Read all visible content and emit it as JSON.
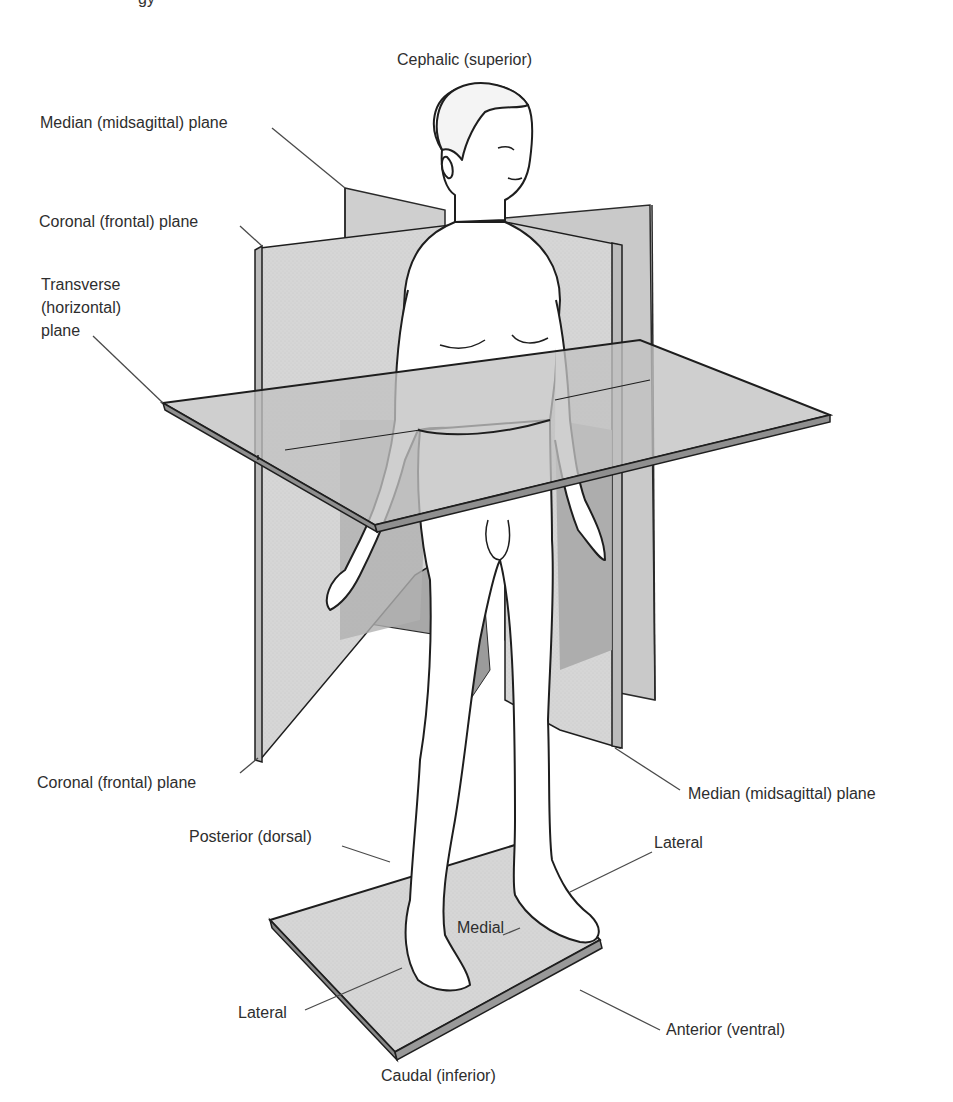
{
  "header_fragment": "gy",
  "title_top": "Cephalic (superior)",
  "title_bottom": "Caudal (inferior)",
  "labels": {
    "median_plane_top": "Median (midsagittal) plane",
    "coronal_plane_top": "Coronal (frontal) plane",
    "transverse_plane": "Transverse (horizontal) plane",
    "transverse_line1": "Transverse",
    "transverse_line2": "(horizontal)",
    "transverse_line3": "plane",
    "coronal_plane_bottom": "Coronal (frontal) plane",
    "median_plane_bottom": "Median (midsagittal) plane",
    "posterior": "Posterior (dorsal)",
    "lateral_right": "Lateral",
    "medial": "Medial",
    "lateral_left": "Lateral",
    "anterior": "Anterior (ventral)"
  },
  "colors": {
    "plane_light": "#d9d9d9",
    "plane_mid": "#bdbdbd",
    "plane_dark": "#9e9e9e",
    "outline": "#1e1e1e",
    "leader": "#4a4a4a",
    "body": "#ffffff"
  }
}
